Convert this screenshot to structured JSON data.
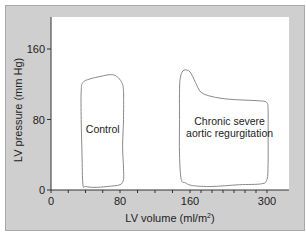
{
  "chart_data": {
    "type": "line",
    "title": "",
    "xlabel": "LV volume (ml/m²)",
    "ylabel": "LV pressure (mm Hg)",
    "x_ticks": [
      0,
      80,
      160,
      300
    ],
    "x_tick_labels": [
      "0",
      "80",
      "160",
      "300"
    ],
    "x_minor_tick_step": 20,
    "y_ticks": [
      0,
      80,
      160
    ],
    "y_tick_labels": [
      "0",
      "80",
      "160"
    ],
    "xlim": [
      0,
      320
    ],
    "ylim": [
      0,
      190
    ],
    "grid": false,
    "legend": "none",
    "colors": {
      "frame_background": "#cfcfcf",
      "plot_background": "#ffffff",
      "axis": "#333333",
      "loop_stroke": "#8a8a8a"
    },
    "series": [
      {
        "name": "Control",
        "label": "Control",
        "label_at": [
          60,
          65
        ],
        "closed": true,
        "points": [
          [
            37,
            6
          ],
          [
            36,
            40
          ],
          [
            35,
            80
          ],
          [
            35,
            112
          ],
          [
            37,
            122
          ],
          [
            45,
            126
          ],
          [
            58,
            129
          ],
          [
            69,
            131
          ],
          [
            76,
            129
          ],
          [
            82,
            122
          ],
          [
            84,
            112
          ],
          [
            84,
            80
          ],
          [
            83,
            50
          ],
          [
            84,
            25
          ],
          [
            84,
            12
          ],
          [
            80,
            6
          ],
          [
            65,
            4
          ],
          [
            50,
            3
          ],
          [
            40,
            4
          ]
        ]
      },
      {
        "name": "Chronic severe aortic regurgitation",
        "label_lines": [
          "Chronic severe",
          "aortic regurgitation"
        ],
        "label_at": [
          232,
          74
        ],
        "closed": true,
        "points": [
          [
            150,
            12
          ],
          [
            148,
            40
          ],
          [
            148,
            80
          ],
          [
            148,
            110
          ],
          [
            149,
            128
          ],
          [
            153,
            136
          ],
          [
            160,
            134
          ],
          [
            170,
            122
          ],
          [
            180,
            111
          ],
          [
            200,
            106
          ],
          [
            230,
            103
          ],
          [
            260,
            102
          ],
          [
            290,
            101
          ],
          [
            300,
            99
          ],
          [
            302,
            90
          ],
          [
            302,
            60
          ],
          [
            302,
            30
          ],
          [
            300,
            12
          ],
          [
            290,
            7
          ],
          [
            250,
            6
          ],
          [
            200,
            4
          ],
          [
            165,
            5
          ],
          [
            155,
            8
          ]
        ]
      }
    ]
  }
}
